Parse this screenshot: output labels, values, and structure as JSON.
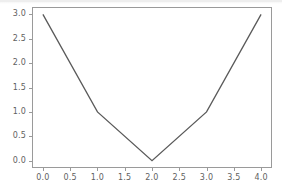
{
  "chart_data": {
    "type": "line",
    "title": "",
    "xlabel": "",
    "ylabel": "",
    "x": [
      0,
      1,
      2,
      3,
      4
    ],
    "values": [
      3,
      1,
      0,
      1,
      3
    ],
    "series": [
      {
        "name": "",
        "x": [
          0,
          1,
          2,
          3,
          4
        ],
        "values": [
          3,
          1,
          0,
          1,
          3
        ]
      }
    ],
    "xlim": [
      -0.2,
      4.2
    ],
    "ylim": [
      -0.15,
      3.15
    ],
    "xticks": [
      0.0,
      0.5,
      1.0,
      1.5,
      2.0,
      2.5,
      3.0,
      3.5,
      4.0
    ],
    "yticks": [
      0.0,
      0.5,
      1.0,
      1.5,
      2.0,
      2.5,
      3.0
    ],
    "xtick_labels": [
      "0.0",
      "0.5",
      "1.0",
      "1.5",
      "2.0",
      "2.5",
      "3.0",
      "3.5",
      "4.0"
    ],
    "ytick_labels": [
      "0.0",
      "0.5",
      "1.0",
      "1.5",
      "2.0",
      "2.5",
      "3.0"
    ],
    "grid": false,
    "legend": null,
    "annotations": [],
    "line_color": "#5a5a5a",
    "axis_color": "#9a9a9a",
    "tick_label_color": "#5f5f5f",
    "background_color": "#ffffff"
  }
}
